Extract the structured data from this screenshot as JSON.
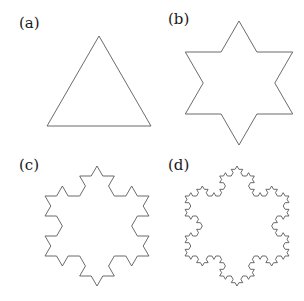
{
  "figure": {
    "stroke_color": "#5a5a5a",
    "stroke_width": 0.9,
    "panels": [
      {
        "id": "a",
        "label": "(a)",
        "label_pos": [
          19,
          16
        ],
        "iteration": 0,
        "center": [
          99,
          96
        ],
        "radius": 60
      },
      {
        "id": "b",
        "label": "(b)",
        "label_pos": [
          168,
          12
        ],
        "iteration": 1,
        "center": [
          239,
          83
        ],
        "radius": 62
      },
      {
        "id": "c",
        "label": "(c)",
        "label_pos": [
          19,
          158
        ],
        "iteration": 2,
        "center": [
          97,
          226
        ],
        "radius": 60
      },
      {
        "id": "d",
        "label": "(d)",
        "label_pos": [
          168,
          158
        ],
        "iteration": 3,
        "center": [
          237,
          226
        ],
        "radius": 60
      }
    ]
  }
}
